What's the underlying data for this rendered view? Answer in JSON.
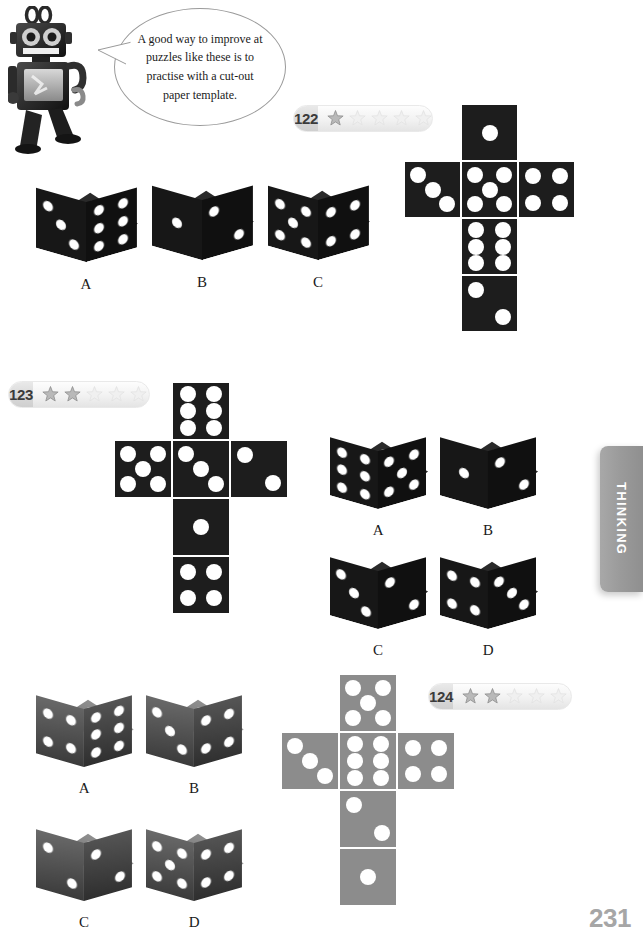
{
  "page": {
    "number": "231",
    "section_tab": "THINKING",
    "background": "#ffffff"
  },
  "mascot": {
    "name": "robot-mascot",
    "speech_bubble": "A good way to improve at puzzles like these is to practise with a cut-out paper template."
  },
  "colors": {
    "die_black": "#1c1c1c",
    "die_gray": "#4a4a4a",
    "net_black": "#1d1d1d",
    "net_gray": "#8c8c8c",
    "pip": "#ffffff",
    "badge_number_bg": "#d9d9d9",
    "badge_bg": "#f2f2f2",
    "star_filled": "#b9b9b9",
    "star_empty": "#f0f0f0",
    "tab_gray": "#9b9b9b",
    "page_number": "#a6a6a6"
  },
  "puzzles": [
    {
      "id": "122",
      "number": "122",
      "difficulty_filled": 1,
      "difficulty_total": 5,
      "net_color": "black",
      "net": {
        "top": 1,
        "left": 3,
        "center": 5,
        "right": 4,
        "below_center": 6,
        "bottom": 2
      },
      "options": [
        {
          "label": "A",
          "top": 5,
          "front": 3,
          "right": 6
        },
        {
          "label": "B",
          "top": 3,
          "front": 1,
          "right": 2
        },
        {
          "label": "C",
          "top": 6,
          "front": 5,
          "right": 4
        }
      ]
    },
    {
      "id": "123",
      "number": "123",
      "difficulty_filled": 2,
      "difficulty_total": 5,
      "net_color": "black",
      "net": {
        "top": 6,
        "left": 5,
        "center": 3,
        "right": 2,
        "below_center": 1,
        "bottom": 4
      },
      "options": [
        {
          "label": "A",
          "top": 3,
          "front": 6,
          "right": 5
        },
        {
          "label": "B",
          "top": 2,
          "front": 1,
          "right": 2
        },
        {
          "label": "C",
          "top": 4,
          "front": 3,
          "right": 2
        },
        {
          "label": "D",
          "top": 6,
          "front": 4,
          "right": 3
        }
      ]
    },
    {
      "id": "124",
      "number": "124",
      "difficulty_filled": 2,
      "difficulty_total": 5,
      "net_color": "gray",
      "net": {
        "top": 5,
        "left": 3,
        "center": 6,
        "right": 4,
        "below_center": 2,
        "bottom": 1
      },
      "options": [
        {
          "label": "A",
          "top": 5,
          "front": 4,
          "right": 6
        },
        {
          "label": "B",
          "top": 5,
          "front": 3,
          "right": 4
        },
        {
          "label": "C",
          "top": 3,
          "front": 2,
          "right": 2
        },
        {
          "label": "D",
          "top": 6,
          "front": 5,
          "right": 4
        }
      ]
    }
  ],
  "layout": {
    "puzzle_122": {
      "badge": {
        "x": 293,
        "y": 105
      },
      "net": {
        "x": 404,
        "y": 104,
        "tile": 57
      },
      "dice": [
        {
          "x": 36,
          "y": 170,
          "size": 54
        },
        {
          "x": 152,
          "y": 168,
          "size": 54
        },
        {
          "x": 268,
          "y": 168,
          "size": 54
        }
      ]
    },
    "puzzle_123": {
      "badge": {
        "x": 8,
        "y": 381
      },
      "net": {
        "x": 114,
        "y": 382,
        "tile": 58
      },
      "dice": [
        {
          "x": 330,
          "y": 420,
          "size": 52
        },
        {
          "x": 440,
          "y": 420,
          "size": 52
        },
        {
          "x": 330,
          "y": 540,
          "size": 52
        },
        {
          "x": 440,
          "y": 540,
          "size": 52
        }
      ]
    },
    "puzzle_124": {
      "badge": {
        "x": 428,
        "y": 683
      },
      "net": {
        "x": 281,
        "y": 674,
        "tile": 58
      },
      "dice": [
        {
          "x": 36,
          "y": 678,
          "size": 52
        },
        {
          "x": 146,
          "y": 678,
          "size": 52
        },
        {
          "x": 36,
          "y": 812,
          "size": 52
        },
        {
          "x": 146,
          "y": 812,
          "size": 52
        }
      ]
    }
  }
}
